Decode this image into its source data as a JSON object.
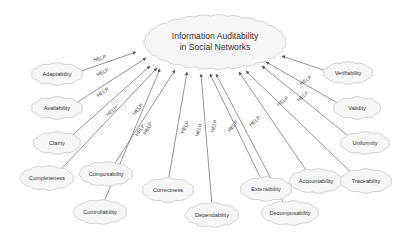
{
  "diagram": {
    "center": {
      "line1": "Information Auditability",
      "line2": "in Social Networks",
      "x": 215,
      "y": 42,
      "w": 140,
      "h": 52
    },
    "edge_label": "HELP",
    "nodes": [
      {
        "id": "adaptability",
        "label": "Adaptability",
        "x": 57,
        "y": 74,
        "w": 50,
        "h": 20,
        "tx": 136,
        "ty": 52,
        "lx": 100,
        "ly": 58,
        "rot": -16
      },
      {
        "id": "availability",
        "label": "Availability",
        "x": 57,
        "y": 108,
        "w": 50,
        "h": 20,
        "tx": 146,
        "ty": 58,
        "lx": 103,
        "ly": 72,
        "rot": -25
      },
      {
        "id": "clarity",
        "label": "Clarity",
        "x": 57,
        "y": 143,
        "w": 46,
        "h": 20,
        "tx": 150,
        "ty": 66,
        "lx": 103,
        "ly": 92,
        "rot": -34
      },
      {
        "id": "completeness",
        "label": "Completeness",
        "x": 47,
        "y": 178,
        "w": 52,
        "h": 22,
        "tx": 157,
        "ty": 68,
        "lx": 112,
        "ly": 111,
        "rot": -40
      },
      {
        "id": "composability",
        "label": "Composability",
        "x": 106,
        "y": 174,
        "w": 52,
        "h": 22,
        "tx": 175,
        "ty": 70,
        "lx": 138,
        "ly": 109,
        "rot": -50
      },
      {
        "id": "controllability",
        "label": "Controllability",
        "x": 100,
        "y": 212,
        "w": 52,
        "h": 22,
        "tx": 160,
        "ty": 69,
        "lx": 140,
        "ly": 130,
        "rot": -55
      },
      {
        "id": "correctness",
        "label": "Correctness",
        "x": 168,
        "y": 190,
        "w": 50,
        "h": 22,
        "tx": 187,
        "ty": 72,
        "lx": 148,
        "ly": 128,
        "rot": -60
      },
      {
        "id": "dependability",
        "label": "Dependability",
        "x": 212,
        "y": 215,
        "w": 52,
        "h": 22,
        "tx": 201,
        "ty": 74,
        "lx": 185,
        "ly": 127,
        "rot": -64
      },
      {
        "id": "extensibility",
        "label": "Extensibility",
        "x": 266,
        "y": 189,
        "w": 50,
        "h": 22,
        "tx": 210,
        "ty": 74,
        "lx": 199,
        "ly": 130,
        "rot": -70
      },
      {
        "id": "decomposability",
        "label": "Decomposability",
        "x": 290,
        "y": 213,
        "w": 56,
        "h": 22,
        "tx": 216,
        "ty": 74,
        "lx": 214,
        "ly": 126,
        "rot": -75
      },
      {
        "id": "accountability",
        "label": "Accountability",
        "x": 316,
        "y": 181,
        "w": 52,
        "h": 22,
        "tx": 239,
        "ty": 72,
        "lx": 233,
        "ly": 126,
        "rot": -50
      },
      {
        "id": "traceability",
        "label": "Traceability",
        "x": 366,
        "y": 181,
        "w": 50,
        "h": 22,
        "tx": 246,
        "ty": 71,
        "lx": 255,
        "ly": 121,
        "rot": -42
      },
      {
        "id": "uniformity",
        "label": "Uniformity",
        "x": 365,
        "y": 143,
        "w": 48,
        "h": 20,
        "tx": 262,
        "ty": 66,
        "lx": 283,
        "ly": 101,
        "rot": -38
      },
      {
        "id": "validity",
        "label": "Validity",
        "x": 357,
        "y": 108,
        "w": 46,
        "h": 20,
        "tx": 266,
        "ty": 62,
        "lx": 303,
        "ly": 96,
        "rot": -40
      },
      {
        "id": "verifiability",
        "label": "Verifiability",
        "x": 348,
        "y": 73,
        "w": 48,
        "h": 20,
        "tx": 282,
        "ty": 56,
        "lx": 306,
        "ly": 80,
        "rot": -35
      }
    ]
  }
}
